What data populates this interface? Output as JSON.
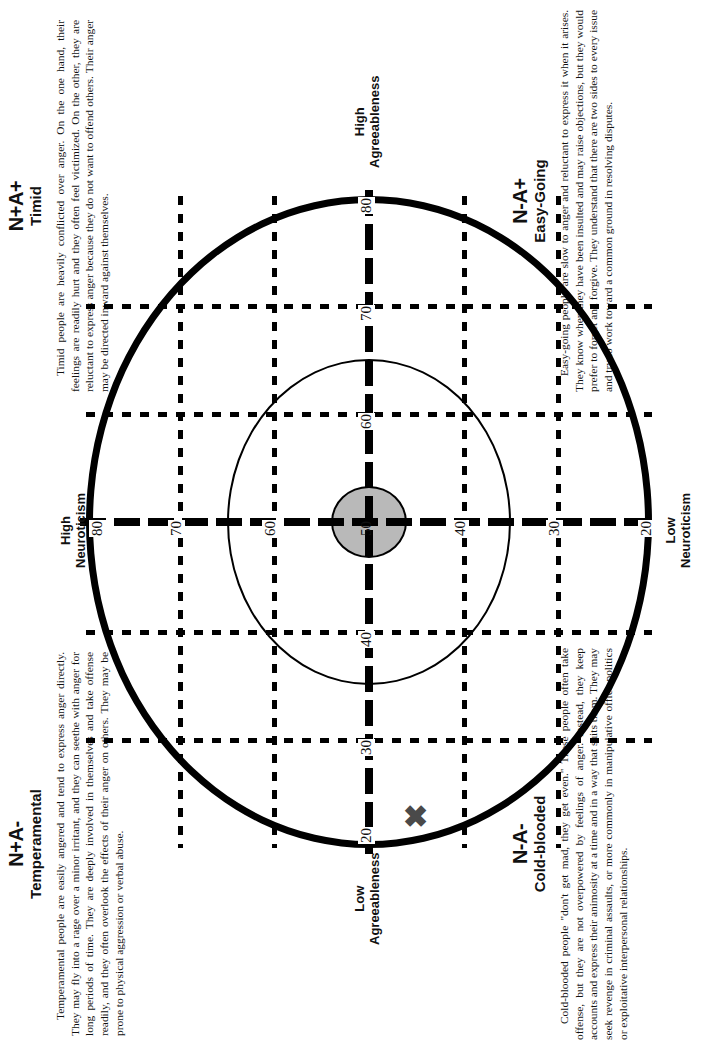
{
  "figure": {
    "type": "circumplex-diagram",
    "axes": {
      "horizontal": {
        "left_label_line1": "High",
        "left_label_line2": "Neuroticism",
        "right_label_line1": "Low",
        "right_label_line2": "Neuroticism",
        "ticks": [
          "80",
          "70",
          "60",
          "50",
          "40",
          "30",
          "20"
        ]
      },
      "vertical": {
        "top_label_line1": "High",
        "top_label_line2": "Agreeableness",
        "bottom_label_line1": "Low",
        "bottom_label_line2": "Agreeableness",
        "ticks": [
          "80",
          "70",
          "60",
          "50",
          "40",
          "30",
          "20"
        ]
      }
    },
    "center_value": "50",
    "marker": {
      "glyph": "✖",
      "color": "#4a4a4a"
    },
    "colors": {
      "line": "#000000",
      "shaded_core": "#b9b9b9",
      "marker": "#4a4a4a",
      "background": "#ffffff"
    }
  },
  "quadrants": [
    {
      "id": "timid",
      "code": "N+A+",
      "name": "Timid",
      "text": "Timid people are heavily conflicted over anger. On the one hand, their feelings are readily hurt and they often feel victimized. On the other, they are reluctant to express anger because they do not want to offend others. Their anger may be directed inward against themselves."
    },
    {
      "id": "easy-going",
      "code": "N-A+",
      "name": "Easy-Going",
      "text": "Easy-going people are slow to anger and reluctant to express it when it arises. They know when they have been insulted and may raise objections, but they would prefer to forget and forgive. They understand that there are two sides to every issue and try to work toward a common ground in resolving disputes."
    },
    {
      "id": "temperamental",
      "code": "N+A-",
      "name": "Temperamental",
      "text": "Temperamental people are easily angered and tend to express anger directly. They may fly into a rage over a minor irritant, and they can seethe with anger for long periods of time. They are deeply involved in themselves and take offense readily, and they often overlook the effects of their anger on others. They may be prone to physical aggression or verbal abuse."
    },
    {
      "id": "cold-blooded",
      "code": "N-A-",
      "name": "Cold-blooded",
      "text": "Cold-blooded people \"don't get mad, they get even.\" These people often take offense, but they are not overpowered by feelings of anger. Instead, they keep accounts and express their animosity at a time and in a way that suits them. They may seek revenge in criminal assaults, or more commonly in manipulative office politics or exploitative interpersonal relationships."
    }
  ]
}
